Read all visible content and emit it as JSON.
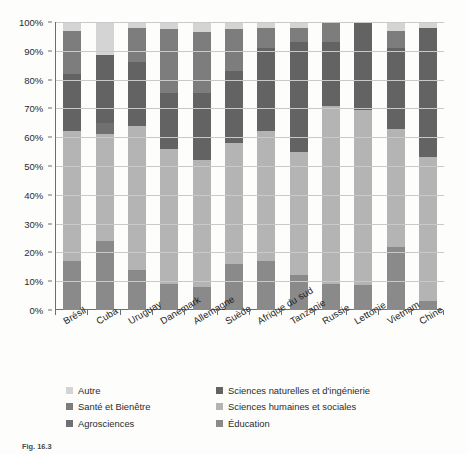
{
  "chart_data": {
    "type": "bar",
    "stacked": true,
    "normalized": true,
    "title": "",
    "subtitle": "",
    "xlabel": "",
    "ylabel": "",
    "ylim": [
      0,
      100
    ],
    "ytick_labels": [
      "0%",
      "10%",
      "20%",
      "30%",
      "40%",
      "50%",
      "60%",
      "70%",
      "80%",
      "90%",
      "100%"
    ],
    "ytick_values": [
      0,
      10,
      20,
      30,
      40,
      50,
      60,
      70,
      80,
      90,
      100
    ],
    "grid": true,
    "legend_position": "bottom",
    "categories": [
      "Brésil",
      "Cuba",
      "Uruguay",
      "Danemark",
      "Allemagne",
      "Suède",
      "Afrique du sud",
      "Tanzanie",
      "Russie",
      "Lettonie",
      "Vietnam",
      "Chine"
    ],
    "series": [
      {
        "name": "Éducation",
        "color": "#8a8a8a",
        "values": [
          17,
          24,
          14,
          9,
          8,
          16,
          17,
          12,
          9,
          9,
          22,
          3
        ]
      },
      {
        "name": "Sciences humaines et sociales",
        "color": "#b4b4b4",
        "values": [
          45,
          37,
          50,
          47,
          44,
          42,
          45,
          43,
          62,
          62,
          41,
          50
        ]
      },
      {
        "name": "Agrosciences",
        "color": "#707070",
        "values": [
          0,
          4,
          0,
          0,
          0,
          0,
          0,
          0,
          0,
          0,
          0,
          0
        ]
      },
      {
        "name": "Sciences naturelles et d'ingénierie",
        "color": "#636363",
        "values": [
          20,
          23.5,
          22,
          19.5,
          23.5,
          25,
          29,
          38,
          22,
          31,
          28,
          45
        ]
      },
      {
        "name": "Santé et Bienêtre",
        "color": "#7d7d7d",
        "values": [
          15,
          0,
          12,
          22,
          21,
          14.5,
          7,
          5,
          7,
          0,
          6,
          0
        ]
      },
      {
        "name": "Autre",
        "color": "#d4d4d4",
        "values": [
          3,
          11.5,
          2,
          2.5,
          3.5,
          2.5,
          2,
          2,
          0,
          0,
          3,
          2
        ]
      }
    ],
    "legend_entries": [
      {
        "label": "Autre",
        "color": "#d4d4d4"
      },
      {
        "label": "Sciences naturelles et d'ingénierie",
        "color": "#636363"
      },
      {
        "label": "Santé et Bienêtre",
        "color": "#7d7d7d"
      },
      {
        "label": "Sciences humaines et sociales",
        "color": "#b4b4b4"
      },
      {
        "label": "Agrosciences",
        "color": "#707070"
      },
      {
        "label": "Éducation",
        "color": "#8a8a8a"
      }
    ]
  },
  "caption": {
    "figure_number": "Fig. 16.3",
    "text": "Fig. 16.3"
  }
}
